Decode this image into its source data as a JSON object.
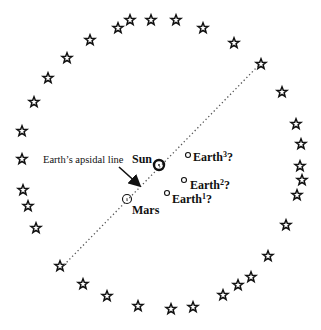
{
  "diagram": {
    "title": "",
    "stars": [
      [
        118,
        28
      ],
      [
        130,
        20
      ],
      [
        151,
        20
      ],
      [
        176,
        20
      ],
      [
        203,
        28
      ],
      [
        234,
        43
      ],
      [
        261,
        64
      ],
      [
        282,
        92
      ],
      [
        296,
        124
      ],
      [
        301,
        144
      ],
      [
        300,
        166
      ],
      [
        302,
        180
      ],
      [
        297,
        195
      ],
      [
        286,
        225
      ],
      [
        268,
        256
      ],
      [
        251,
        277
      ],
      [
        238,
        285
      ],
      [
        223,
        295
      ],
      [
        193,
        307
      ],
      [
        171,
        309
      ],
      [
        138,
        306
      ],
      [
        107,
        296
      ],
      [
        83,
        284
      ],
      [
        60,
        266
      ],
      [
        36,
        228
      ],
      [
        28,
        206
      ],
      [
        23,
        190
      ],
      [
        22,
        159
      ],
      [
        22,
        131
      ],
      [
        34,
        102
      ],
      [
        48,
        78
      ],
      [
        67,
        58
      ],
      [
        90,
        40
      ]
    ],
    "apsidal_line": {
      "x1": 64,
      "y1": 265,
      "x2": 260,
      "y2": 64,
      "label": "Earth’s apsidal line"
    },
    "sun": {
      "label": "Sun",
      "x": 159,
      "y": 165
    },
    "mars": {
      "label": "Mars",
      "x": 127,
      "y": 199
    },
    "earths": [
      {
        "label": "Earth",
        "sup": "1",
        "suffix": "?",
        "x": 167,
        "y": 193
      },
      {
        "label": "Earth",
        "sup": "2",
        "suffix": "?",
        "x": 184,
        "y": 180
      },
      {
        "label": "Earth",
        "sup": "3",
        "suffix": "?",
        "x": 188,
        "y": 155
      }
    ],
    "colors": {
      "ink": "#111111",
      "dots": "#555555",
      "background": "#ffffff"
    }
  }
}
